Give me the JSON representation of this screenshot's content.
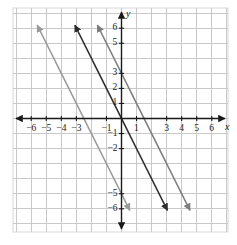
{
  "chart_data": {
    "type": "line",
    "title": "",
    "xlabel": "x",
    "ylabel": "y",
    "xlim": [
      -7,
      7
    ],
    "ylim": [
      -7,
      7
    ],
    "grid": true,
    "grid_step": 1,
    "legend": "none",
    "axis_arrows": true,
    "x_tick_labels": [
      {
        "value": -6,
        "text": "−6"
      },
      {
        "value": -5,
        "text": "−5"
      },
      {
        "value": -4,
        "text": "−4"
      },
      {
        "value": -3,
        "text": "−3"
      },
      {
        "value": -1,
        "text": "−1"
      },
      {
        "value": 1,
        "text": "1"
      },
      {
        "value": 3,
        "text": "3"
      },
      {
        "value": 4,
        "text": "4"
      },
      {
        "value": 5,
        "text": "5"
      },
      {
        "value": 6,
        "text": "6"
      }
    ],
    "y_tick_labels": [
      {
        "value": 6,
        "text": "6"
      },
      {
        "value": 5,
        "text": "5"
      },
      {
        "value": 3,
        "text": "3"
      },
      {
        "value": 2,
        "text": "2"
      },
      {
        "value": 1,
        "text": "1"
      },
      {
        "value": -1,
        "text": "−1"
      },
      {
        "value": -2,
        "text": "−2"
      },
      {
        "value": -5,
        "text": "−5"
      },
      {
        "value": -6,
        "text": "−6"
      }
    ],
    "series": [
      {
        "name": "line-left-light",
        "equation": "y = -2x - 5",
        "slope": -2,
        "intercept": -5,
        "x_intercept": -2.5,
        "color": "#9a9a9a",
        "width": 1.5,
        "arrow_start": true,
        "arrow_end": true,
        "x": [
          -5.6,
          0.55
        ],
        "y": [
          6.2,
          -6.1
        ]
      },
      {
        "name": "line-middle-dark",
        "equation": "y = -2x",
        "slope": -2,
        "intercept": 0,
        "x_intercept": 0,
        "color": "#2b2b2b",
        "width": 1.5,
        "arrow_start": true,
        "arrow_end": true,
        "x": [
          -3.1,
          3.05
        ],
        "y": [
          6.2,
          -6.1
        ]
      },
      {
        "name": "line-right-gray",
        "equation": "y = -2x + 3",
        "slope": -2,
        "intercept": 3,
        "x_intercept": 1.5,
        "color": "#7d7d7d",
        "width": 1.5,
        "arrow_start": true,
        "arrow_end": true,
        "x": [
          -1.6,
          4.55
        ],
        "y": [
          6.2,
          -6.1
        ]
      }
    ],
    "colors": {
      "grid": "#c9c9c9",
      "axis": "#1a1a1a",
      "background": "#ffffff",
      "border": "#d8d8d8"
    }
  }
}
